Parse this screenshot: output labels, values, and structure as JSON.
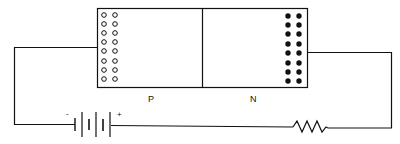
{
  "diagram": {
    "regions": [
      {
        "label": "P",
        "carrier": "holes",
        "carrier_symbol": "hollow-circle",
        "columns": 2,
        "rows": 8
      },
      {
        "label": "N",
        "carrier": "electrons",
        "carrier_symbol": "filled-circle",
        "columns": 2,
        "rows": 8
      }
    ],
    "battery": {
      "negative_label": "-",
      "positive_label": "+"
    },
    "components": [
      "battery",
      "p-n-junction",
      "resistor"
    ],
    "colors": {
      "stroke": "#111111",
      "background": "#ffffff"
    }
  }
}
